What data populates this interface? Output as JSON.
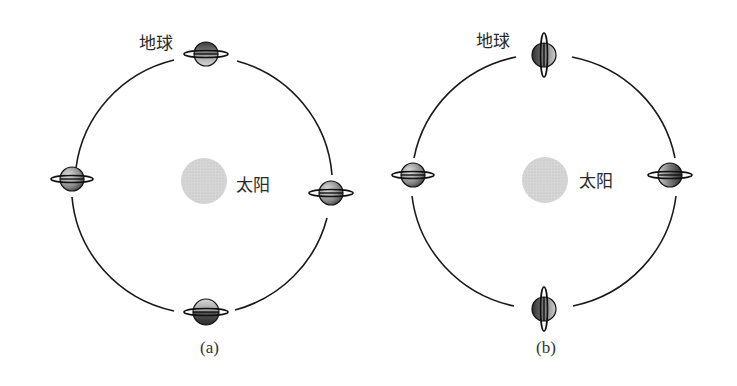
{
  "figure": {
    "panels": [
      {
        "id": "a",
        "caption": "(a)",
        "earth_label": "地球",
        "sun_label": "太阳",
        "axis_orientation": "horizontal-ring",
        "orbit": {
          "cx": 206,
          "cy": 183,
          "rx": 130,
          "ry": 128
        },
        "sun": {
          "cx": 204,
          "cy": 181,
          "r": 23
        },
        "earth_positions": [
          {
            "name": "top",
            "x": 206,
            "y": 54
          },
          {
            "name": "left",
            "x": 72,
            "y": 179
          },
          {
            "name": "right",
            "x": 331,
            "y": 193
          },
          {
            "name": "bottom",
            "x": 206,
            "y": 312
          }
        ]
      },
      {
        "id": "b",
        "caption": "(b)",
        "earth_label": "地球",
        "sun_label": "太阳",
        "axis_orientation": "mixed",
        "orbit": {
          "cx": 544,
          "cy": 181,
          "rx": 131,
          "ry": 128
        },
        "sun": {
          "cx": 545,
          "cy": 180,
          "r": 23
        },
        "earth_positions": [
          {
            "name": "top",
            "x": 544,
            "y": 55,
            "ring": "vertical"
          },
          {
            "name": "left",
            "x": 413,
            "y": 175,
            "ring": "horizontal"
          },
          {
            "name": "right",
            "x": 670,
            "y": 175,
            "ring": "horizontal"
          },
          {
            "name": "bottom",
            "x": 544,
            "y": 309,
            "ring": "vertical"
          }
        ]
      }
    ],
    "colors": {
      "orbit": "#1a1a1a",
      "sun": "#d2d2d2",
      "earth_dark": "#4a4a4a",
      "earth_light": "#c8c8c8",
      "text": "#2a2a2a"
    }
  }
}
